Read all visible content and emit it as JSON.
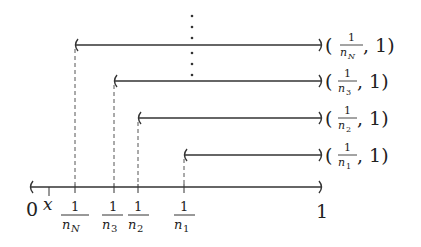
{
  "diagram": {
    "axis": {
      "left_label": "0",
      "right_label": "1",
      "point_label": "x",
      "left_bracket": "(",
      "right_bracket": ")"
    },
    "intervals": [
      {
        "name": "interval-nN",
        "label_num": "1",
        "label_den": "n",
        "label_sub": "N",
        "right_text": ", 1)"
      },
      {
        "name": "interval-n3",
        "label_num": "1",
        "label_den": "n",
        "label_sub": "3",
        "right_text": ", 1)"
      },
      {
        "name": "interval-n2",
        "label_num": "1",
        "label_den": "n",
        "label_sub": "2",
        "right_text": ", 1)"
      },
      {
        "name": "interval-n1",
        "label_num": "1",
        "label_den": "n",
        "label_sub": "1",
        "right_text": ", 1)"
      }
    ],
    "tick_labels": [
      {
        "num": "1",
        "den": "n",
        "sub": "N"
      },
      {
        "num": "1",
        "den": "n",
        "sub": "3"
      },
      {
        "num": "1",
        "den": "n",
        "sub": "2"
      },
      {
        "num": "1",
        "den": "n",
        "sub": "1"
      }
    ],
    "ellipsis": "vertical dots",
    "line_color": "#333333",
    "dash_color": "#555555"
  }
}
